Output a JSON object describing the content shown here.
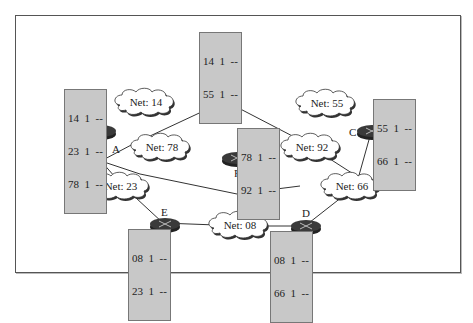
{
  "diagram": {
    "type": "network-topology",
    "routers": [
      {
        "id": "A",
        "label": "A",
        "table": [
          "14  1  --",
          "23  1  --",
          "78  1  --"
        ]
      },
      {
        "id": "B",
        "label": "B",
        "table": [
          "14  1  --",
          "55  1  --"
        ]
      },
      {
        "id": "C",
        "label": "C",
        "table": [
          "55  1  --",
          "66  1  --"
        ]
      },
      {
        "id": "D",
        "label": "D",
        "table": [
          "08  1  --",
          "66  1  --"
        ]
      },
      {
        "id": "E",
        "label": "E",
        "table": [
          "08  1  --",
          "23  1  --"
        ]
      },
      {
        "id": "F",
        "label": "F",
        "table": [
          "78  1  --",
          "92  1  --"
        ]
      }
    ],
    "networks": [
      {
        "id": "14",
        "label": "Net: 14"
      },
      {
        "id": "55",
        "label": "Net: 55"
      },
      {
        "id": "78",
        "label": "Net: 78"
      },
      {
        "id": "92",
        "label": "Net: 92"
      },
      {
        "id": "23",
        "label": "Net: 23"
      },
      {
        "id": "66",
        "label": "Net: 66"
      },
      {
        "id": "08",
        "label": "Net: 08"
      }
    ],
    "links": [
      [
        "A",
        "14"
      ],
      [
        "14",
        "B"
      ],
      [
        "B",
        "55"
      ],
      [
        "55",
        "C"
      ],
      [
        "A",
        "78"
      ],
      [
        "78",
        "F"
      ],
      [
        "F",
        "92"
      ],
      [
        "A",
        "23"
      ],
      [
        "23",
        "E"
      ],
      [
        "E",
        "08"
      ],
      [
        "08",
        "D"
      ],
      [
        "D",
        "66"
      ],
      [
        "66",
        "C"
      ]
    ]
  }
}
